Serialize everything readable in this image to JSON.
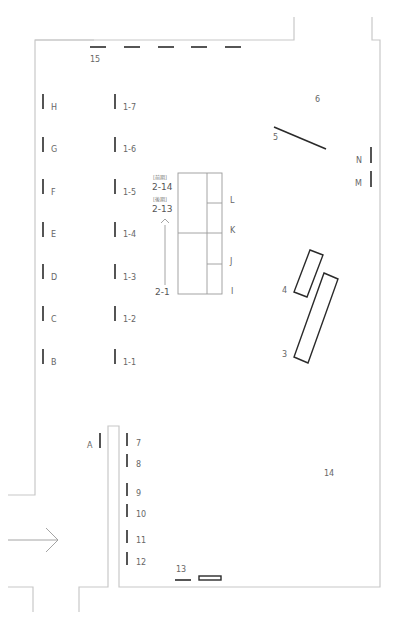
{
  "colors": {
    "wall": "#c8c8c8",
    "marker": "#2a2a2a",
    "label": "#666666",
    "background": "#ffffff"
  },
  "labels": {
    "wall_15": "15",
    "left_wall": [
      "H",
      "G",
      "F",
      "E",
      "D",
      "C",
      "B"
    ],
    "column_1": [
      "1-7",
      "1-6",
      "1-5",
      "1-4",
      "1-3",
      "1-2",
      "1-1"
    ],
    "center_case": {
      "first_term_tag": "[前期]",
      "first_term_num": "2-14",
      "second_term_tag": "[後期]",
      "second_term_num": "2-13",
      "start": "2-1",
      "arrow": "up-arrow-icon"
    },
    "case_right": [
      "L",
      "K",
      "J",
      "I"
    ],
    "diag_5": "5",
    "area_6": "6",
    "right_wall": [
      "N",
      "M"
    ],
    "case_4": "4",
    "case_3": "3",
    "partition_A": "A",
    "corridor": [
      "7",
      "8",
      "9",
      "10",
      "11",
      "12"
    ],
    "wall_13": "13",
    "area_14": "14",
    "entrance_arrow": "right-arrow-icon"
  }
}
